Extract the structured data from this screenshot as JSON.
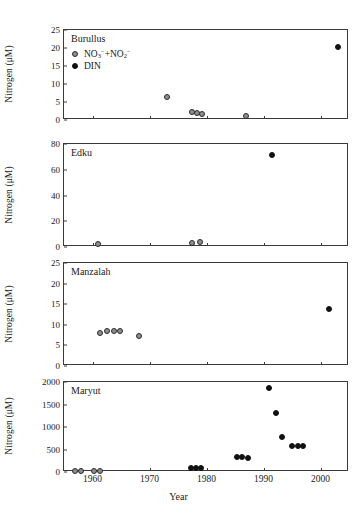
{
  "figure": {
    "xlabel": "Year",
    "ylabel": "Nitrogen (μM)",
    "xlim": [
      1955,
      2005
    ],
    "xticks": [
      1960,
      1970,
      1980,
      1990,
      2000
    ],
    "xticklabels": [
      "1960",
      "1970",
      "1980",
      "1990",
      "2000"
    ],
    "legend": {
      "series1_label_html": "NO<sub>3</sub><sup>−</sup>+NO<sub>2</sub><sup>−</sup>",
      "series1_label": "NO3-+NO2-",
      "series2_label": "DIN",
      "series1_marker": "open-circle",
      "series2_marker": "filled-circle",
      "series1_color": "#8e8e8e",
      "series2_color": "#111111"
    }
  },
  "chart_data": [
    {
      "type": "scatter",
      "title": "Burullus",
      "xlabel": "Year",
      "ylabel": "Nitrogen (μM)",
      "xlim": [
        1955,
        2005
      ],
      "ylim": [
        0,
        25
      ],
      "yticks": [
        0,
        5,
        10,
        15,
        20,
        25
      ],
      "yticklabels": [
        "0",
        "5",
        "10",
        "15",
        "20",
        "25"
      ],
      "grid": false,
      "legend_position": "top-left",
      "series": [
        {
          "name": "NO3-+NO2-",
          "marker": "open-circle",
          "points": [
            {
              "x": 1973.0,
              "y": 6.5
            },
            {
              "x": 1977.5,
              "y": 2.1
            },
            {
              "x": 1978.3,
              "y": 1.9
            },
            {
              "x": 1979.2,
              "y": 1.6
            },
            {
              "x": 1987.0,
              "y": 1.0
            }
          ]
        },
        {
          "name": "DIN",
          "marker": "filled-circle",
          "points": [
            {
              "x": 2003.0,
              "y": 20.4
            }
          ]
        }
      ]
    },
    {
      "type": "scatter",
      "title": "Edku",
      "xlabel": "Year",
      "ylabel": "Nitrogen (μM)",
      "xlim": [
        1955,
        2005
      ],
      "ylim": [
        0,
        80
      ],
      "yticks": [
        0,
        20,
        40,
        60,
        80
      ],
      "yticklabels": [
        "0",
        "20",
        "40",
        "60",
        "80"
      ],
      "grid": false,
      "series": [
        {
          "name": "NO3-+NO2-",
          "marker": "open-circle",
          "points": [
            {
              "x": 1961.0,
              "y": 2.5
            },
            {
              "x": 1977.5,
              "y": 2.8
            },
            {
              "x": 1978.8,
              "y": 3.6
            }
          ]
        },
        {
          "name": "DIN",
          "marker": "filled-circle",
          "points": [
            {
              "x": 1991.5,
              "y": 71.5
            }
          ]
        }
      ]
    },
    {
      "type": "scatter",
      "title": "Manzalah",
      "xlabel": "Year",
      "ylabel": "Nitrogen (μM)",
      "xlim": [
        1955,
        2005
      ],
      "ylim": [
        0,
        25
      ],
      "yticks": [
        0,
        5,
        10,
        15,
        20,
        25
      ],
      "yticklabels": [
        "0",
        "5",
        "10",
        "15",
        "20",
        "25"
      ],
      "grid": false,
      "series": [
        {
          "name": "NO3-+NO2-",
          "marker": "open-circle",
          "points": [
            {
              "x": 1961.3,
              "y": 8.1
            },
            {
              "x": 1962.5,
              "y": 8.4
            },
            {
              "x": 1963.7,
              "y": 8.5
            },
            {
              "x": 1964.9,
              "y": 8.5
            },
            {
              "x": 1968.2,
              "y": 7.4
            }
          ]
        },
        {
          "name": "DIN",
          "marker": "filled-circle",
          "points": [
            {
              "x": 2001.5,
              "y": 13.8
            }
          ]
        }
      ]
    },
    {
      "type": "scatter",
      "title": "Maryut",
      "xlabel": "Year",
      "ylabel": "Nitrogen (μM)",
      "xlim": [
        1955,
        2005
      ],
      "ylim": [
        0,
        2000
      ],
      "yticks": [
        0,
        500,
        1000,
        1500,
        2000
      ],
      "yticklabels": [
        "0",
        "500",
        "1000",
        "1500",
        "2000"
      ],
      "grid": false,
      "series": [
        {
          "name": "NO3-+NO2-",
          "marker": "open-circle",
          "points": [
            {
              "x": 1957.0,
              "y": 15
            },
            {
              "x": 1958.0,
              "y": 15
            },
            {
              "x": 1960.3,
              "y": 15
            },
            {
              "x": 1961.3,
              "y": 15
            }
          ]
        },
        {
          "name": "DIN",
          "marker": "filled-circle",
          "points": [
            {
              "x": 1977.2,
              "y": 85
            },
            {
              "x": 1978.1,
              "y": 85
            },
            {
              "x": 1979.0,
              "y": 85
            },
            {
              "x": 1985.3,
              "y": 330
            },
            {
              "x": 1986.2,
              "y": 330
            },
            {
              "x": 1987.2,
              "y": 305
            },
            {
              "x": 1991.0,
              "y": 1860
            },
            {
              "x": 1992.2,
              "y": 1320
            },
            {
              "x": 1993.3,
              "y": 775
            },
            {
              "x": 1995.0,
              "y": 580
            },
            {
              "x": 1996.0,
              "y": 585
            },
            {
              "x": 1997.0,
              "y": 585
            }
          ]
        }
      ]
    }
  ]
}
